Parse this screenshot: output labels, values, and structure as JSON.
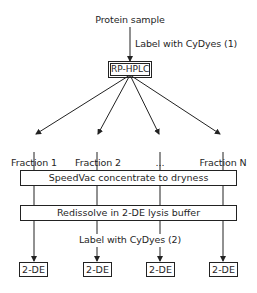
{
  "diagram": {
    "type": "flowchart",
    "start": {
      "label": "Protein sample"
    },
    "step1": {
      "edge_label": "Label with CyDyes (1)"
    },
    "separation": {
      "label": "RP-HPLC"
    },
    "fractions": [
      {
        "label": "Fraction 1"
      },
      {
        "label": "Fraction 2"
      },
      {
        "label": "..."
      },
      {
        "label": "Fraction N"
      }
    ],
    "process_bars": [
      {
        "label": "SpeedVac concentrate to dryness"
      },
      {
        "label": "Redissolve in 2-DE lysis buffer"
      }
    ],
    "step2": {
      "edge_label": "Label with CyDyes (2)"
    },
    "outputs": [
      {
        "label": "2-DE"
      },
      {
        "label": "2-DE"
      },
      {
        "label": "2-DE"
      },
      {
        "label": "2-DE"
      }
    ],
    "colors": {
      "line": "#222222",
      "text": "#1f1f1f",
      "background": "#ffffff"
    }
  }
}
